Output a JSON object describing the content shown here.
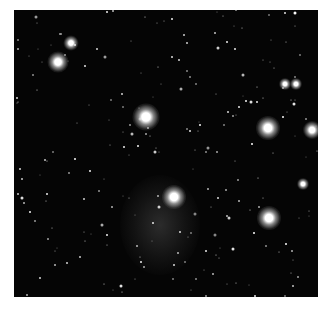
{
  "image": {
    "subject": "star field with bright stars and faint nebulosity",
    "background_color": "#050505",
    "frame_color": "#ffffff",
    "bright_stars": [
      {
        "x": 58,
        "y": 62,
        "r": 7
      },
      {
        "x": 71,
        "y": 43,
        "r": 5
      },
      {
        "x": 146,
        "y": 117,
        "r": 9
      },
      {
        "x": 268,
        "y": 128,
        "r": 8
      },
      {
        "x": 312,
        "y": 130,
        "r": 6
      },
      {
        "x": 174,
        "y": 197,
        "r": 8
      },
      {
        "x": 269,
        "y": 218,
        "r": 8
      },
      {
        "x": 285,
        "y": 84,
        "r": 4
      },
      {
        "x": 296,
        "y": 84,
        "r": 4
      },
      {
        "x": 303,
        "y": 184,
        "r": 4
      }
    ],
    "nebula": {
      "x": 160,
      "y": 225,
      "rx": 40,
      "ry": 50,
      "color": "#3a3a3a"
    }
  }
}
